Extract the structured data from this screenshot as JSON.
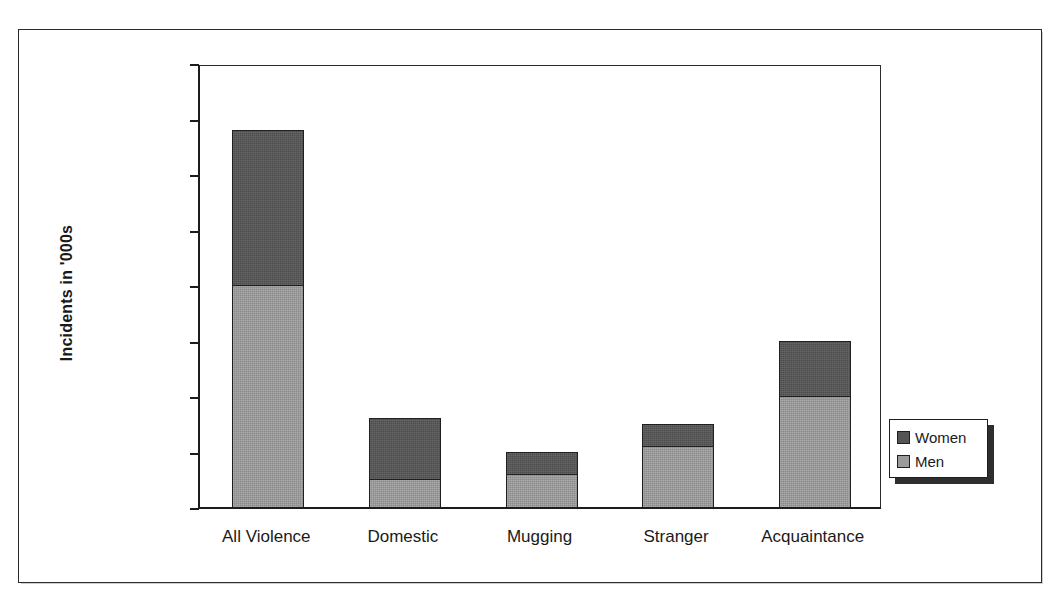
{
  "chart_data": {
    "type": "bar",
    "subtype": "stacked-vertical",
    "title": "",
    "xlabel": "",
    "ylabel": "Incidents in '000s",
    "ylim": [
      0,
      4000
    ],
    "ytick_step": 500,
    "ytick_labels": [
      "4,000",
      "3,500",
      "3,000",
      "2,500",
      "2,000",
      "1,500",
      "1,000",
      "500",
      "0"
    ],
    "ytick_values": [
      4000,
      3500,
      3000,
      2500,
      2000,
      1500,
      1000,
      500,
      0
    ],
    "grid": false,
    "legend_position": "right-lower",
    "categories": [
      "All Violence",
      "Domestic",
      "Mugging",
      "Stranger",
      "Acquaintance"
    ],
    "series": [
      {
        "name": "Men",
        "color": "#9b9b9b",
        "stack_order": "bottom",
        "values": [
          2000,
          250,
          300,
          550,
          1000
        ]
      },
      {
        "name": "Women",
        "color": "#555555",
        "stack_order": "top",
        "values": [
          1400,
          550,
          200,
          200,
          500
        ]
      }
    ],
    "totals": [
      3400,
      800,
      500,
      750,
      1500
    ]
  },
  "legend": {
    "entries": [
      {
        "label": "Women",
        "swatch": "dark-gray-swatch"
      },
      {
        "label": "Men",
        "swatch": "light-gray-swatch"
      }
    ]
  },
  "axes": {
    "y_title": "Incidents in '000s"
  }
}
